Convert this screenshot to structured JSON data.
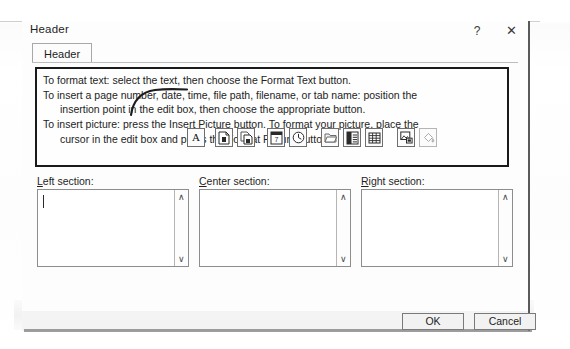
{
  "window": {
    "title": "Header",
    "help_button": "?",
    "close_button": "✕"
  },
  "tabs": [
    {
      "label": "Header",
      "active": true
    }
  ],
  "instructions": {
    "line1": "To format text:  select the text, then choose the Format Text button.",
    "line2": "To insert a page number, date, time, file path, filename, or tab name:  position the",
    "line2_cont": "insertion point in the edit box, then choose the appropriate button.",
    "line3": "To insert picture: press the Insert Picture button.  To format your picture, place the",
    "line3_cont": "cursor in the edit box and press the Format Picture button."
  },
  "toolbar": {
    "buttons": [
      {
        "name": "format-text-button",
        "label": "A",
        "enabled": true
      },
      {
        "name": "insert-page-number-button",
        "label": "",
        "enabled": true
      },
      {
        "name": "insert-number-of-pages-button",
        "label": "",
        "enabled": true
      },
      {
        "name": "insert-date-button",
        "label": "",
        "enabled": true
      },
      {
        "name": "insert-time-button",
        "label": "",
        "enabled": true
      },
      {
        "name": "insert-file-path-button",
        "label": "",
        "enabled": true
      },
      {
        "name": "insert-file-name-button",
        "label": "",
        "enabled": true
      },
      {
        "name": "insert-sheet-name-button",
        "label": "",
        "enabled": true
      },
      {
        "name": "insert-picture-button",
        "label": "",
        "enabled": true
      },
      {
        "name": "format-picture-button",
        "label": "",
        "enabled": false
      }
    ]
  },
  "sections": [
    {
      "label_prefix": "L",
      "label_rest": "eft section:",
      "value": "",
      "scroll_up": "∧",
      "scroll_down": "∨"
    },
    {
      "label_prefix": "C",
      "label_rest": "enter section:",
      "value": "",
      "scroll_up": "∧",
      "scroll_down": "∨"
    },
    {
      "label_prefix": "R",
      "label_rest": "ight section:",
      "value": "",
      "scroll_up": "∧",
      "scroll_down": "∨"
    }
  ],
  "footer": {
    "ok_label": "OK",
    "cancel_label": "Cancel"
  },
  "colors": {
    "dialog_bg": "#fdfdfd",
    "border": "#8d8d8d",
    "text": "#232323",
    "info_border": "#1a1a1a"
  }
}
